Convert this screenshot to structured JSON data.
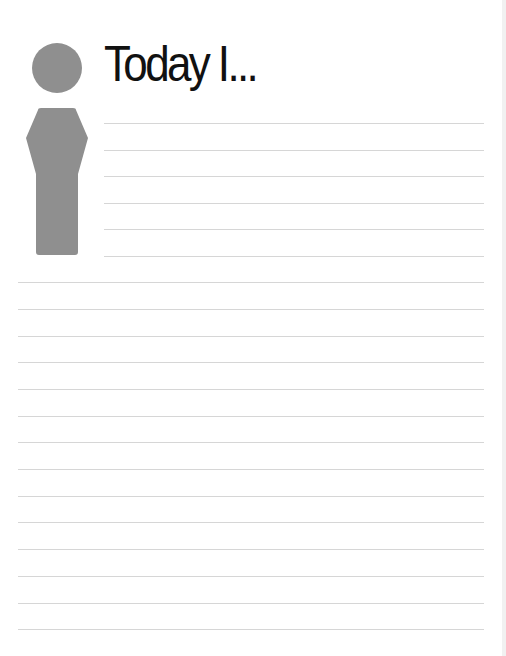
{
  "page": {
    "title": "Today I...",
    "figure_color": "#8f8f8f",
    "line_color": "#d6d6d6",
    "short_lines_y": [
      123,
      150,
      176,
      203,
      229,
      256
    ],
    "full_lines_y": [
      282,
      309,
      336,
      362,
      389,
      416,
      442,
      469,
      496,
      522,
      549,
      576,
      603,
      629
    ]
  }
}
